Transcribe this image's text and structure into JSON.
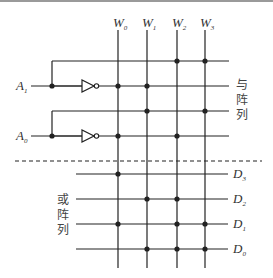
{
  "diagram": {
    "type": "ROM/PLA array",
    "columns": [
      {
        "name": "W",
        "sub": "0",
        "x": 118
      },
      {
        "name": "W",
        "sub": "1",
        "x": 147
      },
      {
        "name": "W",
        "sub": "2",
        "x": 177
      },
      {
        "name": "W",
        "sub": "3",
        "x": 205
      }
    ],
    "inputs": [
      {
        "name": "A",
        "sub": "1",
        "y": 86
      },
      {
        "name": "A",
        "sub": "0",
        "y": 136
      }
    ],
    "and_rows_y": [
      61,
      86,
      111,
      136
    ],
    "and_dots": [
      [
        2,
        3
      ],
      [
        0,
        1
      ],
      [
        1,
        3
      ],
      [
        0,
        2
      ]
    ],
    "or_rows": [
      {
        "name": "D",
        "sub": "3",
        "y": 174,
        "dots": [
          0
        ]
      },
      {
        "name": "D",
        "sub": "2",
        "y": 199,
        "dots": [
          1,
          2
        ]
      },
      {
        "name": "D",
        "sub": "1",
        "y": 224,
        "dots": [
          0,
          2,
          3
        ]
      },
      {
        "name": "D",
        "sub": "0",
        "y": 249,
        "dots": [
          1,
          2,
          3
        ]
      }
    ],
    "and_array_label": [
      "与",
      "阵",
      "列"
    ],
    "or_array_label": [
      "或",
      "阵",
      "列"
    ],
    "line_color": "#222222"
  }
}
